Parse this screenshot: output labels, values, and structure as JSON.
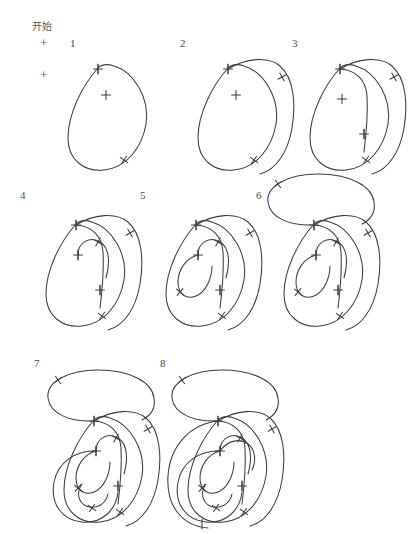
{
  "page": {
    "title": "开始",
    "background_color": "#ffffff",
    "ink_color": "#3d3d3d",
    "width": 386,
    "height": 495
  },
  "header": {
    "start_label": "开始",
    "registration_marks": [
      {
        "name": "reg-mark-top",
        "glyph": "+",
        "x": 40,
        "y": 36
      },
      {
        "name": "reg-mark-bottom",
        "glyph": "+",
        "x": 40,
        "y": 68
      }
    ]
  },
  "grid": {
    "rows": 3,
    "columns": [
      3,
      3,
      2
    ]
  },
  "panels": [
    {
      "number": "1",
      "label_x": 70,
      "label_y": 38,
      "origin_x": 30,
      "origin_y": 12,
      "paths": [
        "M 68 26 C 52 44 38 72 38 96 C 38 118 54 130 74 128 C 96 126 112 106 116 82 C 120 56 104 30 84 24 C 78 22 72 22 68 26 Z"
      ],
      "plus_marks": [
        {
          "x": 68,
          "y": 27
        },
        {
          "x": 76,
          "y": 53
        }
      ],
      "cross_ticks": [
        {
          "x": 94,
          "y": 118,
          "angle": 35
        }
      ],
      "bar_ticks": [
        {
          "x": 68,
          "y": 27,
          "angle": 90
        }
      ]
    },
    {
      "number": "2",
      "label_x": 180,
      "label_y": 38,
      "origin_x": 160,
      "origin_y": 12,
      "paths": [
        "M 68 26 C 52 44 38 72 38 96 C 38 118 54 130 74 128 C 96 126 112 106 116 82 C 120 56 104 30 84 24 C 78 22 72 22 68 26 Z",
        "M 68 27 C 86 16 108 14 120 24 C 134 36 136 62 132 86 C 128 110 116 128 100 132"
      ],
      "plus_marks": [
        {
          "x": 68,
          "y": 27
        },
        {
          "x": 76,
          "y": 53
        }
      ],
      "cross_ticks": [
        {
          "x": 94,
          "y": 118,
          "angle": 35
        },
        {
          "x": 122,
          "y": 35,
          "angle": 60
        }
      ],
      "bar_ticks": [
        {
          "x": 68,
          "y": 27,
          "angle": 90
        }
      ]
    },
    {
      "number": "3",
      "label_x": 292,
      "label_y": 38,
      "origin_x": 272,
      "origin_y": 12,
      "paths": [
        "M 68 26 C 52 44 38 72 38 96 C 38 118 54 130 74 128 C 96 126 112 106 116 82 C 120 56 104 30 84 24 C 78 22 72 22 68 26 Z",
        "M 68 27 C 86 16 108 14 120 24 C 134 36 136 62 132 86 C 128 110 116 128 100 132",
        "M 68 27 C 84 28 94 38 95 54 C 96 72 94 94 92 110"
      ],
      "plus_marks": [
        {
          "x": 68,
          "y": 27
        },
        {
          "x": 70,
          "y": 57
        },
        {
          "x": 92,
          "y": 92
        }
      ],
      "cross_ticks": [
        {
          "x": 94,
          "y": 118,
          "angle": 35
        },
        {
          "x": 122,
          "y": 35,
          "angle": 60
        }
      ],
      "bar_ticks": [
        {
          "x": 68,
          "y": 27,
          "angle": 90
        },
        {
          "x": 92,
          "y": 92,
          "angle": 90
        }
      ]
    },
    {
      "number": "4",
      "label_x": 20,
      "label_y": 190,
      "origin_x": 8,
      "origin_y": 168,
      "paths": [
        "M 68 26 C 52 44 38 72 38 96 C 38 118 54 130 74 128 C 96 126 112 106 116 82 C 120 56 104 30 84 24 C 78 22 72 22 68 26 Z",
        "M 68 27 C 86 16 108 14 120 24 C 134 36 136 62 132 86 C 128 110 116 128 100 132",
        "M 68 27 C 84 28 94 38 95 54 C 96 72 94 94 92 110",
        "M 70 57 C 70 44 82 38 92 44 C 102 50 102 66 98 80"
      ],
      "plus_marks": [
        {
          "x": 68,
          "y": 27
        },
        {
          "x": 70,
          "y": 57
        },
        {
          "x": 92,
          "y": 92
        }
      ],
      "cross_ticks": [
        {
          "x": 94,
          "y": 118,
          "angle": 35
        },
        {
          "x": 122,
          "y": 35,
          "angle": 60
        },
        {
          "x": 90,
          "y": 44,
          "angle": 30
        }
      ],
      "bar_ticks": [
        {
          "x": 68,
          "y": 27,
          "angle": 90
        },
        {
          "x": 70,
          "y": 57,
          "angle": 90
        },
        {
          "x": 92,
          "y": 92,
          "angle": 90
        }
      ]
    },
    {
      "number": "5",
      "label_x": 140,
      "label_y": 190,
      "origin_x": 128,
      "origin_y": 168,
      "paths": [
        "M 68 26 C 52 44 38 72 38 96 C 38 118 54 130 74 128 C 96 126 112 106 116 82 C 120 56 104 30 84 24 C 78 22 72 22 68 26 Z",
        "M 68 27 C 86 16 108 14 120 24 C 134 36 136 62 132 86 C 128 110 116 128 100 132",
        "M 68 27 C 84 28 94 38 95 54 C 96 72 94 94 92 110",
        "M 70 57 C 70 44 82 38 92 44 C 102 50 102 66 98 80",
        "M 70 57 C 58 60 50 72 50 84 C 50 96 58 102 68 98 C 78 94 84 80 84 68"
      ],
      "plus_marks": [
        {
          "x": 68,
          "y": 27
        },
        {
          "x": 70,
          "y": 57
        },
        {
          "x": 92,
          "y": 92
        }
      ],
      "cross_ticks": [
        {
          "x": 94,
          "y": 118,
          "angle": 35
        },
        {
          "x": 122,
          "y": 35,
          "angle": 60
        },
        {
          "x": 90,
          "y": 44,
          "angle": 30
        },
        {
          "x": 52,
          "y": 94,
          "angle": 40
        }
      ],
      "bar_ticks": [
        {
          "x": 68,
          "y": 27,
          "angle": 90
        },
        {
          "x": 70,
          "y": 57,
          "angle": 90
        },
        {
          "x": 92,
          "y": 92,
          "angle": 90
        }
      ]
    },
    {
      "number": "6",
      "label_x": 256,
      "label_y": 190,
      "origin_x": 246,
      "origin_y": 168,
      "paths": [
        "M 68 26 C 52 44 38 72 38 96 C 38 118 54 130 74 128 C 96 126 112 106 116 82 C 120 56 104 30 84 24 C 78 22 72 22 68 26 Z",
        "M 68 27 C 86 16 108 14 120 24 C 134 36 136 62 132 86 C 128 110 116 128 100 132",
        "M 68 27 C 84 28 94 38 95 54 C 96 72 94 94 92 110",
        "M 70 57 C 70 44 82 38 92 44 C 102 50 102 66 98 80",
        "M 70 57 C 58 60 50 72 50 84 C 50 96 58 102 68 98 C 78 94 84 80 84 68",
        "M 68 27 C 44 28 24 20 22 4 C 20 -12 42 -24 72 -24 C 104 -24 126 -12 128 4 C 130 16 124 22 116 26"
      ],
      "plus_marks": [
        {
          "x": 68,
          "y": 27
        },
        {
          "x": 70,
          "y": 57
        },
        {
          "x": 92,
          "y": 92
        }
      ],
      "cross_ticks": [
        {
          "x": 94,
          "y": 118,
          "angle": 35
        },
        {
          "x": 122,
          "y": 35,
          "angle": 60
        },
        {
          "x": 90,
          "y": 44,
          "angle": 30
        },
        {
          "x": 52,
          "y": 94,
          "angle": 40
        },
        {
          "x": 32,
          "y": -14,
          "angle": 55
        }
      ],
      "bar_ticks": [
        {
          "x": 68,
          "y": 27,
          "angle": 90
        },
        {
          "x": 70,
          "y": 57,
          "angle": 90
        },
        {
          "x": 92,
          "y": 92,
          "angle": 90
        }
      ]
    },
    {
      "number": "7",
      "label_x": 34,
      "label_y": 358,
      "origin_x": 26,
      "origin_y": 364,
      "paths": [
        "M 68 26 C 52 44 38 72 38 96 C 38 118 54 130 74 128 C 96 126 112 106 116 82 C 120 56 104 30 84 24 C 78 22 72 22 68 26 Z",
        "M 68 27 C 86 16 108 14 120 24 C 134 36 136 62 132 86 C 128 110 116 128 100 132",
        "M 68 27 C 84 28 94 38 95 54 C 96 72 94 94 92 110",
        "M 70 57 C 70 44 82 38 92 44 C 102 50 102 66 98 80",
        "M 70 57 C 58 60 50 72 50 84 C 50 96 58 102 68 98 C 78 94 84 80 84 68",
        "M 68 27 C 44 28 24 20 22 4 C 20 -12 42 -24 72 -24 C 104 -24 126 -12 128 4 C 130 16 124 22 116 26",
        "M 70 57 C 50 56 32 68 28 88 C 24 110 36 126 56 128 C 76 130 90 116 92 98",
        "M 56 90 C 50 98 52 108 60 112 C 70 116 80 110 82 100"
      ],
      "plus_marks": [
        {
          "x": 68,
          "y": 27
        },
        {
          "x": 70,
          "y": 57
        },
        {
          "x": 92,
          "y": 92
        }
      ],
      "cross_ticks": [
        {
          "x": 94,
          "y": 118,
          "angle": 35
        },
        {
          "x": 122,
          "y": 35,
          "angle": 60
        },
        {
          "x": 90,
          "y": 44,
          "angle": 30
        },
        {
          "x": 52,
          "y": 94,
          "angle": 40
        },
        {
          "x": 32,
          "y": -14,
          "angle": 55
        },
        {
          "x": 66,
          "y": 114,
          "angle": 35
        }
      ],
      "bar_ticks": [
        {
          "x": 68,
          "y": 27,
          "angle": 90
        },
        {
          "x": 70,
          "y": 57,
          "angle": 90
        },
        {
          "x": 92,
          "y": 92,
          "angle": 90
        }
      ]
    },
    {
      "number": "8",
      "label_x": 160,
      "label_y": 358,
      "origin_x": 150,
      "origin_y": 364,
      "paths": [
        "M 68 26 C 52 44 38 72 38 96 C 38 118 54 130 74 128 C 96 126 112 106 116 82 C 120 56 104 30 84 24 C 78 22 72 22 68 26 Z",
        "M 68 27 C 86 16 108 14 120 24 C 134 36 136 62 132 86 C 128 110 116 128 100 132",
        "M 68 27 C 84 28 94 38 95 54 C 96 72 94 94 92 110",
        "M 70 57 C 70 44 82 38 92 44 C 102 50 102 66 98 80",
        "M 70 57 C 58 60 50 72 50 84 C 50 96 58 102 68 98 C 78 94 84 80 84 68",
        "M 68 27 C 44 28 24 20 22 4 C 20 -12 42 -24 72 -24 C 104 -24 126 -12 128 4 C 130 16 124 22 116 26",
        "M 70 57 C 50 56 32 68 28 88 C 24 110 36 126 56 128 C 76 130 90 116 92 98",
        "M 56 90 C 50 98 52 108 60 112 C 70 116 80 110 82 100",
        "M 68 27 C 40 30 20 52 18 82 C 16 112 32 132 58 134",
        "M 70 57 C 78 46 90 44 98 50 C 106 56 106 68 102 76"
      ],
      "plus_marks": [
        {
          "x": 68,
          "y": 27
        },
        {
          "x": 70,
          "y": 57
        },
        {
          "x": 92,
          "y": 92
        }
      ],
      "cross_ticks": [
        {
          "x": 94,
          "y": 118,
          "angle": 35
        },
        {
          "x": 122,
          "y": 35,
          "angle": 60
        },
        {
          "x": 90,
          "y": 44,
          "angle": 30
        },
        {
          "x": 52,
          "y": 94,
          "angle": 40
        },
        {
          "x": 32,
          "y": -14,
          "angle": 55
        },
        {
          "x": 66,
          "y": 114,
          "angle": 35
        }
      ],
      "bar_ticks": [
        {
          "x": 68,
          "y": 27,
          "angle": 90
        },
        {
          "x": 70,
          "y": 57,
          "angle": 90
        },
        {
          "x": 92,
          "y": 92,
          "angle": 90
        },
        {
          "x": 52,
          "y": 130,
          "angle": 90
        }
      ]
    }
  ]
}
